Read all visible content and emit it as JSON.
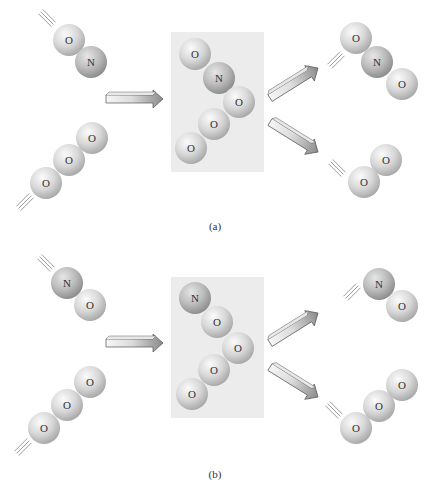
{
  "atom_colors": {
    "O": {
      "light": "#f4f4f4",
      "mid": "#d6d6d6",
      "dark": "#a9a9a9"
    },
    "N": {
      "light": "#e4e4e4",
      "mid": "#bdbdbd",
      "dark": "#8f8f8f"
    }
  },
  "box_color": "#ececec",
  "panels": [
    {
      "id": "a",
      "caption": "(a)",
      "caption_pos": [
        215,
        230
      ],
      "box": {
        "x": 171,
        "y": 32,
        "w": 93,
        "h": 140
      },
      "reactants": [
        {
          "name": "NO",
          "atoms": [
            {
              "el": "O",
              "x": 69,
              "y": 40
            },
            {
              "el": "N",
              "x": 91,
              "y": 62
            }
          ],
          "motion": {
            "x": 47,
            "y": 18,
            "angle": 45
          }
        },
        {
          "name": "O3",
          "atoms": [
            {
              "el": "O",
              "x": 92,
              "y": 138
            },
            {
              "el": "O",
              "x": 69,
              "y": 160
            },
            {
              "el": "O",
              "x": 46,
              "y": 183
            }
          ],
          "motion": {
            "x": 25,
            "y": 202,
            "angle": -45
          }
        }
      ],
      "complex": [
        {
          "el": "O",
          "x": 195,
          "y": 54
        },
        {
          "el": "N",
          "x": 219,
          "y": 78
        },
        {
          "el": "O",
          "x": 239,
          "y": 102
        },
        {
          "el": "O",
          "x": 214,
          "y": 124
        },
        {
          "el": "O",
          "x": 191,
          "y": 148
        }
      ],
      "products": [
        {
          "name": "NO2",
          "atoms": [
            {
              "el": "O",
              "x": 356,
              "y": 38
            },
            {
              "el": "N",
              "x": 377,
              "y": 62
            },
            {
              "el": "O",
              "x": 402,
              "y": 84
            }
          ],
          "motion": {
            "x": 336,
            "y": 60,
            "angle": -45
          }
        },
        {
          "name": "O2",
          "atoms": [
            {
              "el": "O",
              "x": 386,
              "y": 160
            },
            {
              "el": "O",
              "x": 364,
              "y": 182
            }
          ],
          "motion": {
            "x": 337,
            "y": 168,
            "angle": 45
          }
        }
      ],
      "arrow_in": {
        "x1": 106,
        "y1": 99,
        "x2": 163,
        "y2": 99
      },
      "arrows_out": [
        {
          "x1": 270,
          "y1": 98,
          "x2": 318,
          "y2": 68
        },
        {
          "x1": 270,
          "y1": 122,
          "x2": 318,
          "y2": 152
        }
      ]
    },
    {
      "id": "b",
      "caption": "(b)",
      "caption_pos": [
        215,
        478
      ],
      "box": {
        "x": 171,
        "y": 277,
        "w": 93,
        "h": 141
      },
      "reactants": [
        {
          "name": "NO",
          "atoms": [
            {
              "el": "N",
              "x": 67,
              "y": 283
            },
            {
              "el": "O",
              "x": 90,
              "y": 305
            }
          ],
          "motion": {
            "x": 46,
            "y": 263,
            "angle": 45
          }
        },
        {
          "name": "O3",
          "atoms": [
            {
              "el": "O",
              "x": 90,
              "y": 382
            },
            {
              "el": "O",
              "x": 67,
              "y": 405
            },
            {
              "el": "O",
              "x": 44,
              "y": 428
            }
          ],
          "motion": {
            "x": 23,
            "y": 447,
            "angle": -45
          }
        }
      ],
      "complex": [
        {
          "el": "N",
          "x": 195,
          "y": 298
        },
        {
          "el": "O",
          "x": 217,
          "y": 322
        },
        {
          "el": "O",
          "x": 238,
          "y": 348
        },
        {
          "el": "O",
          "x": 214,
          "y": 370
        },
        {
          "el": "O",
          "x": 192,
          "y": 394
        }
      ],
      "products": [
        {
          "name": "NO",
          "atoms": [
            {
              "el": "N",
              "x": 379,
              "y": 284
            },
            {
              "el": "O",
              "x": 402,
              "y": 306
            }
          ],
          "motion": {
            "x": 352,
            "y": 292,
            "angle": -45
          }
        },
        {
          "name": "O3",
          "atoms": [
            {
              "el": "O",
              "x": 402,
              "y": 385
            },
            {
              "el": "O",
              "x": 379,
              "y": 406
            },
            {
              "el": "O",
              "x": 356,
              "y": 428
            }
          ],
          "motion": {
            "x": 334,
            "y": 410,
            "angle": 45
          }
        }
      ],
      "arrow_in": {
        "x1": 106,
        "y1": 343,
        "x2": 163,
        "y2": 343
      },
      "arrows_out": [
        {
          "x1": 270,
          "y1": 343,
          "x2": 318,
          "y2": 313
        },
        {
          "x1": 270,
          "y1": 367,
          "x2": 318,
          "y2": 397
        }
      ]
    }
  ],
  "atom_radius": 16
}
